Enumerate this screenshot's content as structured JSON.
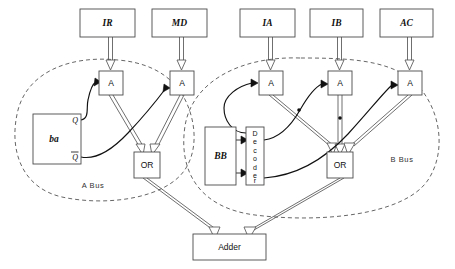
{
  "diagram": {
    "type": "block-diagram",
    "background": "#ffffff",
    "line_color": "#111111",
    "box_stroke": "#4a4a4a"
  },
  "registers": [
    {
      "id": "ir",
      "label": "IR",
      "x": 80,
      "y": 9,
      "w": 55,
      "h": 28,
      "bus": "A"
    },
    {
      "id": "md",
      "label": "MD",
      "x": 152,
      "y": 9,
      "w": 55,
      "h": 28,
      "bus": "A"
    },
    {
      "id": "ia",
      "label": "IA",
      "x": 240,
      "y": 9,
      "w": 55,
      "h": 28,
      "bus": "B"
    },
    {
      "id": "ib",
      "label": "IB",
      "x": 310,
      "y": 9,
      "w": 53,
      "h": 28,
      "bus": "B"
    },
    {
      "id": "ac",
      "label": "AC",
      "x": 380,
      "y": 9,
      "w": 53,
      "h": 28,
      "bus": "B"
    }
  ],
  "and_gates": [
    {
      "id": "a1",
      "label": "A",
      "x": 99,
      "y": 71,
      "w": 24,
      "h": 24,
      "bus": "A"
    },
    {
      "id": "a2",
      "label": "A",
      "x": 170,
      "y": 71,
      "w": 24,
      "h": 24,
      "bus": "A"
    },
    {
      "id": "a3",
      "label": "A",
      "x": 259,
      "y": 71,
      "w": 24,
      "h": 24,
      "bus": "B"
    },
    {
      "id": "a4",
      "label": "A",
      "x": 328,
      "y": 71,
      "w": 24,
      "h": 24,
      "bus": "B"
    },
    {
      "id": "a5",
      "label": "A",
      "x": 398,
      "y": 71,
      "w": 24,
      "h": 24,
      "bus": "B"
    }
  ],
  "or_gates": [
    {
      "id": "or_a",
      "label": "OR",
      "x": 134,
      "y": 152,
      "w": 26,
      "h": 26,
      "bus": "A"
    },
    {
      "id": "or_b",
      "label": "OR",
      "x": 327,
      "y": 152,
      "w": 26,
      "h": 26,
      "bus": "B"
    }
  ],
  "flipflop": {
    "id": "ba",
    "label": "ba",
    "q_label": "Q",
    "qbar_label": "Q",
    "qbar_overline": true,
    "x": 33,
    "y": 114,
    "w": 48,
    "h": 50
  },
  "bb_register": {
    "id": "bb",
    "label": "BB",
    "x": 205,
    "y": 127,
    "w": 31,
    "h": 58
  },
  "decoder": {
    "id": "decoder",
    "label": "Decoder",
    "letters": [
      "D",
      "e",
      "c",
      "o",
      "d",
      "e",
      "r"
    ],
    "orientation": "vertical",
    "x": 246,
    "y": 127,
    "w": 18,
    "h": 58
  },
  "adder": {
    "id": "adder",
    "label": "Adder",
    "x": 193,
    "y": 234,
    "w": 73,
    "h": 26
  },
  "bus_regions": [
    {
      "id": "a_bus",
      "label": "A Bus",
      "label_x": 93,
      "label_y": 186
    },
    {
      "id": "b_bus",
      "label": "B Bus",
      "label_x": 402,
      "label_y": 160
    }
  ],
  "connections": [
    {
      "from": "ir",
      "to": "a1",
      "style": "double-line-arrow"
    },
    {
      "from": "md",
      "to": "a2",
      "style": "double-line-arrow"
    },
    {
      "from": "ia",
      "to": "a3",
      "style": "double-line-arrow"
    },
    {
      "from": "ib",
      "to": "a4",
      "style": "double-line-arrow"
    },
    {
      "from": "ac",
      "to": "a5",
      "style": "double-line-arrow"
    },
    {
      "from": "ba.Q",
      "to": "a1",
      "style": "control-curve"
    },
    {
      "from": "ba.Qbar",
      "to": "a2",
      "style": "control-curve"
    },
    {
      "from": "a1",
      "to": "or_a",
      "style": "double-line-arrow"
    },
    {
      "from": "a2",
      "to": "or_a",
      "style": "double-line-arrow"
    },
    {
      "from": "bb",
      "to": "decoder",
      "style": "solid-arrow"
    },
    {
      "from": "decoder",
      "to": "a3",
      "style": "control-curve"
    },
    {
      "from": "decoder",
      "to": "a4",
      "style": "control-curve"
    },
    {
      "from": "decoder",
      "to": "a5",
      "style": "control-curve"
    },
    {
      "from": "a3",
      "to": "or_b",
      "style": "double-line-arrow"
    },
    {
      "from": "a4",
      "to": "or_b",
      "style": "double-line-arrow"
    },
    {
      "from": "a5",
      "to": "or_b",
      "style": "double-line-arrow"
    },
    {
      "from": "or_a",
      "to": "adder",
      "style": "double-line-arrow"
    },
    {
      "from": "or_b",
      "to": "adder",
      "style": "double-line-arrow"
    }
  ]
}
